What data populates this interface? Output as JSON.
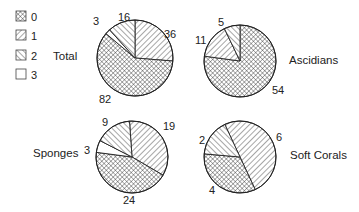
{
  "chart_data": [
    {
      "type": "pie",
      "title": "Total",
      "categories": [
        "0",
        "1",
        "2",
        "3"
      ],
      "values": [
        82,
        36,
        16,
        3
      ]
    },
    {
      "type": "pie",
      "title": "Ascidians",
      "categories": [
        "0",
        "1",
        "2",
        "3"
      ],
      "values": [
        54,
        11,
        5,
        0
      ]
    },
    {
      "type": "pie",
      "title": "Sponges",
      "categories": [
        "0",
        "1",
        "2",
        "3"
      ],
      "values": [
        24,
        19,
        9,
        3
      ]
    },
    {
      "type": "pie",
      "title": "Soft Corals",
      "categories": [
        "0",
        "1",
        "2",
        "3"
      ],
      "values": [
        4,
        6,
        2,
        0
      ]
    }
  ],
  "legend": {
    "position": "top-left",
    "entries": [
      {
        "label": "0",
        "pattern": "crosshatch"
      },
      {
        "label": "1",
        "pattern": "hatch-descending"
      },
      {
        "label": "2",
        "pattern": "hatch-ascending"
      },
      {
        "label": "3",
        "pattern": "empty"
      }
    ]
  },
  "labels": {
    "total": {
      "title": "Total",
      "v0": "82",
      "v1": "36",
      "v2": "16",
      "v3": "3"
    },
    "ascidians": {
      "title": "Ascidians",
      "v0": "54",
      "v1": "11",
      "v2": "5"
    },
    "sponges": {
      "title": "Sponges",
      "v0": "24",
      "v1": "19",
      "v2": "9",
      "v3": "3"
    },
    "soft_corals": {
      "title": "Soft Corals",
      "v0": "4",
      "v1": "6",
      "v2": "2"
    }
  },
  "colors": {
    "ink": "#222222",
    "background": "#ffffff"
  }
}
